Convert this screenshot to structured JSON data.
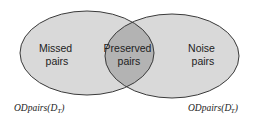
{
  "diagram": {
    "type": "venn",
    "colors": {
      "set_fill": "#d9d9d9",
      "overlap_fill": "#b3b3b3",
      "stroke": "#3a3a3a",
      "text": "#222222"
    },
    "sets": [
      {
        "id": "left",
        "label": "ODpairs(D_T)",
        "label_main": "ODpairs(D",
        "label_sub": "T",
        "label_end": ")"
      },
      {
        "id": "right",
        "label": "ODpairs(D'_T)",
        "label_main": "ODpairs(D",
        "label_sup": "′",
        "label_sub": "T",
        "label_end": ")"
      }
    ],
    "regions": {
      "left_only": {
        "line1": "Missed",
        "line2": "pairs"
      },
      "overlap": {
        "line1": "Preserved",
        "line2": "pairs"
      },
      "right_only": {
        "line1": "Noise",
        "line2": "pairs"
      }
    }
  }
}
